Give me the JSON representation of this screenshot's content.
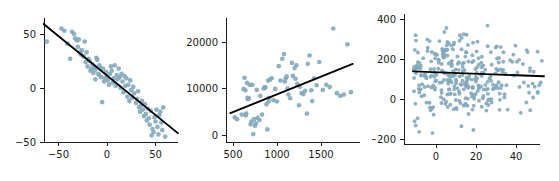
{
  "figure": {
    "background": "#ffffff",
    "point_color": "#82a9bd",
    "point_opacity": 0.9,
    "line_color": "#000000",
    "axis_color": "#1a1a1a",
    "panel_count": 3
  },
  "chart_data": [
    {
      "type": "scatter",
      "title": "",
      "xlabel": "",
      "ylabel": "",
      "xlim": [
        -72,
        78
      ],
      "ylim": [
        -62,
        70
      ],
      "xticks": [
        -50,
        0,
        50
      ],
      "yticks": [
        -50,
        0,
        50
      ],
      "xticklabels": [
        "−50",
        "0",
        "50"
      ],
      "yticklabels": [
        "−50",
        "0",
        "50"
      ],
      "grid": false,
      "legend": "none",
      "trendline": {
        "type": "linear",
        "slope": -0.73,
        "intercept": 11.5,
        "x_start": -67,
        "x_end": 73
      },
      "x": [
        -62,
        -47,
        -44,
        -41,
        -38,
        -36,
        -34,
        -33,
        -31,
        -30,
        -29,
        -28,
        -27,
        -26,
        -25,
        -24,
        -23,
        -22,
        -21,
        -20,
        -19,
        -18,
        -17,
        -16,
        -15,
        -14,
        -13,
        -12,
        -12,
        -11,
        -10,
        -9,
        -8,
        -8,
        -7,
        -6,
        -5,
        -4,
        -3,
        -2,
        -1,
        0,
        1,
        2,
        3,
        4,
        5,
        6,
        7,
        8,
        9,
        10,
        11,
        12,
        13,
        14,
        15,
        16,
        17,
        18,
        19,
        20,
        21,
        22,
        23,
        24,
        25,
        26,
        27,
        28,
        30,
        31,
        32,
        33,
        34,
        35,
        36,
        37,
        38,
        39,
        40,
        41,
        42,
        43,
        44,
        45,
        46,
        47,
        48,
        49,
        50,
        51,
        52,
        53,
        54,
        55,
        56,
        57,
        58,
        60
      ],
      "y": [
        43,
        55,
        53,
        41,
        27,
        52,
        50,
        46,
        44,
        38,
        45,
        33,
        31,
        35,
        30,
        29,
        43,
        24,
        33,
        20,
        27,
        25,
        16,
        18,
        22,
        14,
        20,
        17,
        8,
        28,
        26,
        13,
        12,
        21,
        19,
        10,
        -13,
        18,
        6,
        9,
        15,
        11,
        7,
        3,
        13,
        20,
        16,
        5,
        9,
        21,
        2,
        12,
        8,
        18,
        10,
        0,
        13,
        6,
        -4,
        11,
        2,
        9,
        -8,
        3,
        -12,
        7,
        -2,
        -9,
        1,
        -5,
        -14,
        -10,
        -3,
        -18,
        -22,
        -16,
        -12,
        -20,
        -26,
        -15,
        -24,
        -30,
        -19,
        -28,
        -34,
        -21,
        -44,
        -38,
        -41,
        -27,
        -31,
        -20,
        -36,
        -43,
        -25,
        -22,
        -32,
        -39,
        -18,
        -45
      ]
    },
    {
      "type": "scatter",
      "title": "",
      "xlabel": "",
      "ylabel": "",
      "xlim": [
        430,
        1900
      ],
      "ylim": [
        -2500,
        25500
      ],
      "xticks": [
        500,
        1000,
        1500
      ],
      "yticks": [
        0,
        10000,
        20000
      ],
      "xticklabels": [
        "500",
        "1000",
        "1500"
      ],
      "yticklabels": [
        "0",
        "10000",
        "20000"
      ],
      "grid": false,
      "legend": "none",
      "trendline": {
        "type": "linear",
        "slope": 7.6,
        "intercept": 1150,
        "x_start": 470,
        "x_end": 1860
      },
      "x": [
        520,
        545,
        600,
        620,
        630,
        640,
        645,
        650,
        660,
        665,
        670,
        680,
        690,
        700,
        710,
        720,
        730,
        740,
        750,
        760,
        770,
        780,
        800,
        810,
        830,
        850,
        860,
        870,
        880,
        890,
        900,
        905,
        910,
        920,
        940,
        960,
        980,
        1000,
        1020,
        1040,
        1060,
        1080,
        1090,
        1100,
        1110,
        1120,
        1130,
        1150,
        1170,
        1180,
        1200,
        1210,
        1220,
        1230,
        1250,
        1260,
        1280,
        1300,
        1320,
        1340,
        1350,
        1370,
        1390,
        1400,
        1420,
        1450,
        1480,
        1520,
        1560,
        1600,
        1640,
        1680,
        1720,
        1760,
        1800,
        1840
      ],
      "y": [
        3800,
        3400,
        4400,
        9900,
        12300,
        9600,
        4200,
        4600,
        11200,
        8000,
        7700,
        7900,
        10800,
        2300,
        2900,
        10800,
        200,
        3400,
        2000,
        2500,
        9700,
        3700,
        3200,
        8400,
        4400,
        10000,
        10300,
        10200,
        6600,
        1200,
        11700,
        7200,
        8000,
        11900,
        12200,
        7500,
        9900,
        7200,
        14800,
        11700,
        16400,
        17400,
        11500,
        12200,
        12600,
        10000,
        8700,
        7900,
        15500,
        12700,
        14400,
        12100,
        15000,
        11000,
        6400,
        10400,
        9000,
        8800,
        9500,
        4600,
        15300,
        17100,
        9600,
        7300,
        12200,
        10700,
        15700,
        9700,
        10800,
        10300,
        22900,
        9000,
        8400,
        8700,
        19500,
        9200
      ]
    },
    {
      "type": "scatter",
      "title": "",
      "xlabel": "",
      "ylabel": "",
      "xlim": [
        -13,
        56
      ],
      "ylim": [
        -250,
        430
      ],
      "xticks": [
        0,
        20,
        40
      ],
      "yticks": [
        -200,
        0,
        200,
        400
      ],
      "xticklabels": [
        "0",
        "20",
        "40"
      ],
      "yticklabels": [
        "−200",
        "0",
        "200",
        "400"
      ],
      "grid": false,
      "legend": "none",
      "trendline": {
        "type": "linear",
        "slope": -0.38,
        "intercept": 134,
        "x_start": -11.5,
        "x_end": 54
      },
      "n_points": 330,
      "x_range": [
        -11,
        54
      ],
      "y_range": [
        -185,
        370
      ],
      "y_center": 130,
      "note": "dense cloud, flat near-zero slope"
    }
  ]
}
